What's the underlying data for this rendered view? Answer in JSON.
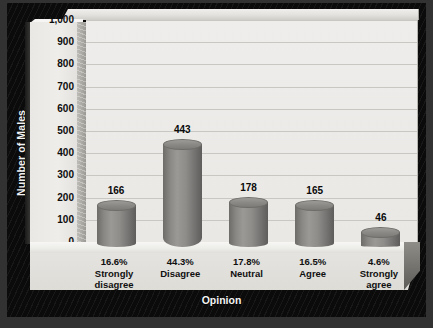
{
  "chart_data": {
    "type": "bar",
    "title": "",
    "xlabel": "Opinion",
    "ylabel": "Number of Males",
    "categories": [
      "Strongly disagree",
      "Disagree",
      "Neutral",
      "Agree",
      "Strongly agree"
    ],
    "category_lines": [
      [
        "Strongly",
        "disagree"
      ],
      [
        "Disagree"
      ],
      [
        "Neutral"
      ],
      [
        "Agree"
      ],
      [
        "Strongly",
        "agree"
      ]
    ],
    "values": [
      166,
      443,
      178,
      165,
      46
    ],
    "value_labels": [
      "166",
      "443",
      "178",
      "165",
      "46"
    ],
    "percent_labels": [
      "16.6%",
      "44.3%",
      "17.8%",
      "16.5%",
      "4.6%"
    ],
    "percents": [
      16.6,
      44.3,
      17.8,
      16.5,
      4.6
    ],
    "ylim": [
      0,
      1000
    ],
    "ytick_values": [
      1000,
      900,
      800,
      700,
      600,
      500,
      400,
      300,
      200,
      100,
      0
    ],
    "ytick_labels": [
      "1,000",
      "900",
      "800",
      "700",
      "600",
      "500",
      "400",
      "300",
      "200",
      "100",
      "0"
    ],
    "grid": true,
    "legend": "none",
    "style": "3d-cylinder",
    "colors": {
      "bar": "#8b8986",
      "plot_background": "#eceae7",
      "gridline": "#c9c7c2",
      "axis_text": "#0d0d0d",
      "frame": "#0b0b0b",
      "outer_background": "#333232",
      "axis_title_text": "#f2f2f2"
    }
  }
}
